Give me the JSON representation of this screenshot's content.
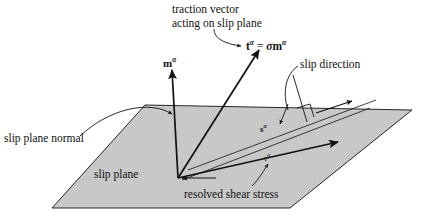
{
  "figure": {
    "type": "crystal-plasticity-slip-system-schematic",
    "background_color": "#ffffff",
    "plane_fill_color": "#c8c8c8",
    "line_color": "#111111"
  },
  "labels": {
    "traction_line1": "traction vector",
    "traction_line2": "acting on slip plane",
    "slip_direction": "slip direction",
    "slip_plane_normal": "slip plane normal",
    "slip_plane": "slip plane",
    "resolved_shear_stress": "resolved shear stress"
  },
  "symbols": {
    "normal_vector": "m",
    "normal_vector_sup": "α",
    "traction_vector": "t",
    "traction_vector_sup": "α",
    "stress_tensor": "σ",
    "slip_direction_vector": "s",
    "slip_direction_vector_sup": "α",
    "shear_stress": "τ",
    "shear_stress_sup": "α",
    "equals": "="
  },
  "geometry": {
    "plane_corners": [
      [
        145,
        105
      ],
      [
        412,
        110
      ],
      [
        290,
        208
      ],
      [
        52,
        208
      ]
    ],
    "origin": [
      178,
      178
    ],
    "normal_tip": [
      172,
      68
    ],
    "traction_tip": [
      262,
      48
    ],
    "slip_line_start": [
      178,
      178
    ],
    "slip_line_end": [
      350,
      112
    ],
    "right_angle_marker": [
      305,
      118
    ]
  }
}
